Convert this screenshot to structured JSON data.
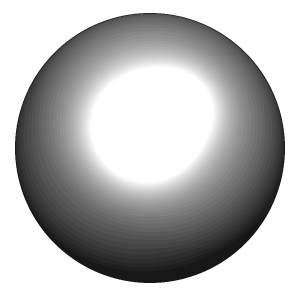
{
  "image": {
    "title": "Shaded sphere render",
    "kind": "3d-render",
    "width": 300,
    "height": 296,
    "background_color": "#ffffff"
  },
  "sphere": {
    "label": "sphere",
    "center_x": 150,
    "center_y": 148,
    "radius": 135,
    "outline_color": "#141414",
    "outline_width": 1.2
  },
  "shading": {
    "model": "phong-quantized",
    "quantization_levels": 34,
    "banding": true,
    "ambient": 0.06,
    "diffuse_gain": 0.74,
    "specular_gain": 0.95,
    "specular_exponent": 14,
    "rim_darkening": 0.42,
    "highlight_color": "#ffffff",
    "shadow_color": "#0a0a0a",
    "midtone_color": "#9e9e9e",
    "light": {
      "label": "key-light",
      "screen_x": 150,
      "screen_y": 140,
      "direction": [
        -0.12,
        -0.34,
        0.93
      ],
      "secondary_direction": [
        0.46,
        -0.62,
        0.64
      ],
      "secondary_weight": 0.38
    },
    "gray_samples": [
      {
        "name": "highlight-core",
        "x": 150,
        "y": 141,
        "value": 255
      },
      {
        "name": "upper-ridge",
        "x": 196,
        "y": 78,
        "value": 226
      },
      {
        "name": "top-rim",
        "x": 150,
        "y": 22,
        "value": 176
      },
      {
        "name": "upper-left",
        "x": 72,
        "y": 80,
        "value": 158
      },
      {
        "name": "left-mid",
        "x": 36,
        "y": 155,
        "value": 162
      },
      {
        "name": "lower-left",
        "x": 55,
        "y": 215,
        "value": 86
      },
      {
        "name": "bottom-dark-lobe",
        "x": 105,
        "y": 262,
        "value": 14
      },
      {
        "name": "bottom-mid",
        "x": 165,
        "y": 255,
        "value": 36
      },
      {
        "name": "bottom-right",
        "x": 225,
        "y": 235,
        "value": 30
      },
      {
        "name": "right-mid",
        "x": 262,
        "y": 160,
        "value": 28
      },
      {
        "name": "right-upper",
        "x": 250,
        "y": 105,
        "value": 62
      },
      {
        "name": "center-below-highlight",
        "x": 150,
        "y": 190,
        "value": 128
      }
    ]
  }
}
